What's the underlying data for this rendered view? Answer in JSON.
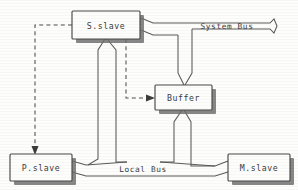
{
  "diagram": {
    "nodes": [
      {
        "id": "s_slave",
        "label": "S.slave",
        "x": 72,
        "y": 11,
        "w": 68,
        "h": 28
      },
      {
        "id": "buffer",
        "label": "Buffer",
        "x": 155,
        "y": 85,
        "w": 57,
        "h": 25
      },
      {
        "id": "p_slave",
        "label": "P.slave",
        "x": 10,
        "y": 154,
        "w": 62,
        "h": 27
      },
      {
        "id": "m_slave",
        "label": "M.slave",
        "x": 228,
        "y": 154,
        "w": 62,
        "h": 27
      }
    ],
    "buses": [
      {
        "id": "system_bus",
        "label": "System Bus",
        "label_x": 227,
        "label_y": 27
      },
      {
        "id": "local_bus",
        "label": "Local Bus",
        "label_x": 143,
        "label_y": 170
      }
    ],
    "connections": [
      {
        "id": "sysbus-to-sslave",
        "style": "ribbon",
        "from": "s_slave",
        "to": "system_bus"
      },
      {
        "id": "sysbus-to-buffer",
        "style": "ribbon",
        "from": "system_bus",
        "to": "buffer"
      },
      {
        "id": "sslave-to-localbus",
        "style": "ribbon",
        "from": "s_slave",
        "to": "local_bus"
      },
      {
        "id": "buffer-to-localbus",
        "style": "ribbon",
        "from": "buffer",
        "to": "local_bus"
      },
      {
        "id": "localbus-to-pslave",
        "style": "ribbon",
        "from": "local_bus",
        "to": "p_slave"
      },
      {
        "id": "localbus-to-mslave",
        "style": "ribbon",
        "from": "local_bus",
        "to": "m_slave"
      },
      {
        "id": "sslave-to-pslave-ctrl",
        "style": "dashed-arrow",
        "from": "s_slave",
        "to": "p_slave"
      },
      {
        "id": "sslave-to-buffer-ctrl",
        "style": "dashed-arrow",
        "from": "s_slave",
        "to": "buffer"
      }
    ],
    "colors": {
      "background": "#fdfdfb",
      "stroke": "#4a4a4a",
      "shadow": "#6d6d6d",
      "text": "#3a3a3a"
    }
  }
}
